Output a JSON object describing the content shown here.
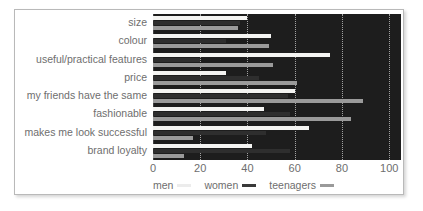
{
  "chart_data": {
    "type": "bar",
    "orientation": "horizontal",
    "title": "",
    "xlabel": "",
    "ylabel": "",
    "xlim": [
      0,
      105
    ],
    "xticks": [
      0,
      20,
      40,
      60,
      80,
      100
    ],
    "tick_labels": [
      "0",
      "20",
      "40",
      "60",
      "80",
      "100"
    ],
    "grid": true,
    "legend_position": "bottom-left",
    "plot_background": "#1d1d1d",
    "categories": [
      "size",
      "colour",
      "useful/practical features",
      "price",
      "my friends have the same",
      "fashionable",
      "makes me look successful",
      "brand loyalty"
    ],
    "series": [
      {
        "name": "men",
        "color": "#f4f4f2",
        "values": [
          40,
          50,
          75,
          31,
          60,
          47,
          66,
          42
        ]
      },
      {
        "name": "women",
        "color": "#2e2e2e",
        "values": [
          37,
          31,
          20,
          45,
          57,
          58,
          48,
          58
        ]
      },
      {
        "name": "teenagers",
        "color": "#9a9a9a",
        "values": [
          36,
          49,
          51,
          61,
          89,
          84,
          17,
          13
        ]
      }
    ]
  },
  "legend": {
    "items": [
      {
        "label": "men",
        "key": "men"
      },
      {
        "label": "women",
        "key": "women"
      },
      {
        "label": "teenagers",
        "key": "teen"
      }
    ]
  }
}
